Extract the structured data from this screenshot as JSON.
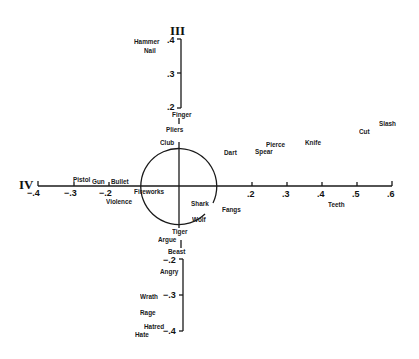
{
  "diagram": {
    "axis_labels": {
      "top": "III",
      "left": "IV"
    },
    "ticks": {
      "upper": [
        ".4",
        ".3",
        ".2"
      ],
      "x_negative": [
        "−.4",
        "−.3",
        "−.2"
      ],
      "x_positive": [
        ".2",
        ".3",
        ".4",
        ".5",
        ".6"
      ],
      "lower": [
        "−.2",
        "−.3",
        "−.4"
      ]
    },
    "words": {
      "hammer": "Hammer",
      "nail": "Nail",
      "finger": "Finger",
      "pliers": "Pliers",
      "club": "Club",
      "dart": "Dart",
      "spear": "Spear",
      "pierce": "Pierce",
      "knife": "Knife",
      "cut": "Cut",
      "slash": "Slash",
      "pistol": "Pistol",
      "gun": "Gun",
      "bullet": "Bullet",
      "fireworks": "Fireworks",
      "violence": "Violence",
      "shark": "Shark",
      "wolf": "Wolf",
      "fangs": "Fangs",
      "teeth": "Teeth",
      "tiger": "Tiger",
      "argue": "Argue",
      "beast": "Beast",
      "angry": "Angry",
      "wrath": "Wrath",
      "rage": "Rage",
      "hatred": "Hatred",
      "hate": "Hate"
    },
    "colors": {
      "ink": "#1a1a1a",
      "background": "#ffffff"
    }
  }
}
